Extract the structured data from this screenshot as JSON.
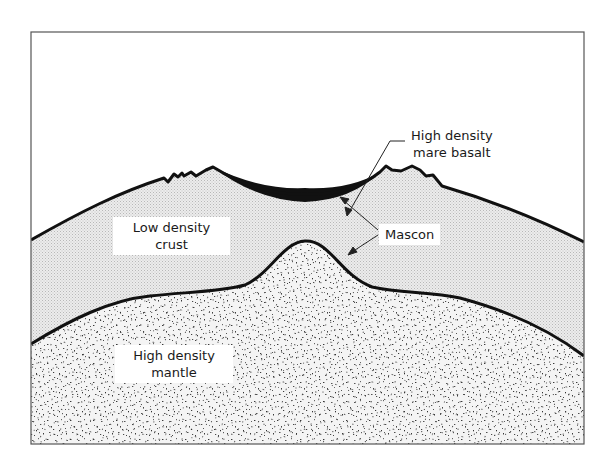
{
  "figure": {
    "labels": {
      "mare_basalt": {
        "line1": "High density",
        "line2": "mare basalt"
      },
      "mascon": {
        "text": "Mascon"
      },
      "crust": {
        "line1": "Low density",
        "line2": "crust"
      },
      "mantle": {
        "line1": "High density",
        "line2": "mantle"
      }
    },
    "colors": {
      "outline": "#111111",
      "crust_fill": "#e4e4e4",
      "mantle_fill": "#f2f2f2",
      "speckle": "#3a3a3a",
      "basalt": "#111111",
      "frame": "#555555"
    }
  }
}
